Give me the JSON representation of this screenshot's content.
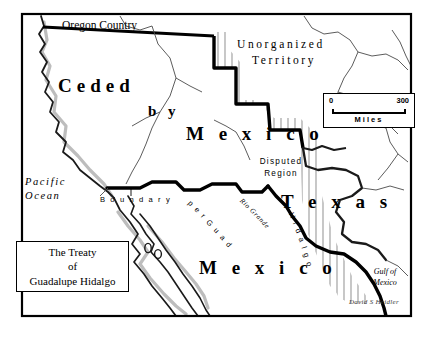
{
  "map": {
    "title_box": {
      "line1": "The Treaty",
      "line2": "of",
      "line3": "Guadalupe Hidalgo"
    },
    "scale": {
      "min": "0",
      "max": "300",
      "unit": "Miles"
    },
    "signature": "David S Heidler",
    "regions": [
      {
        "name": "ceded-word-1",
        "label": "Ceded"
      },
      {
        "name": "ceded-word-2",
        "label": "b y"
      },
      {
        "name": "ceded-word-3",
        "label": "M e x i c o"
      },
      {
        "name": "oregon-country",
        "label": "Oregon Country"
      },
      {
        "name": "unorganized-line1",
        "label": "Unorganized"
      },
      {
        "name": "unorganized-line2",
        "label": "Territory"
      },
      {
        "name": "texas",
        "label": "T e x a s"
      },
      {
        "name": "mexico",
        "label": "M e x i c o"
      },
      {
        "name": "disputed-line1",
        "label": "Disputed"
      },
      {
        "name": "disputed-line2",
        "label": "Region"
      },
      {
        "name": "pacific-line1",
        "label": "Pacific"
      },
      {
        "name": "pacific-line2",
        "label": "Ocean"
      },
      {
        "name": "gulf-line1",
        "label": "Gulf of"
      },
      {
        "name": "gulf-line2",
        "label": "Mexico"
      }
    ],
    "boundary_label": {
      "word1": "B o u n d a r y",
      "curve": "p e r   G u a d a l u p e",
      "curve2": "H i d a l g o",
      "river": "Rio Grande"
    },
    "colors": {
      "ink": "#000000",
      "paper": "#ffffff",
      "hatch": "#9a9a9a",
      "shadow": "#b9b9b9",
      "thin_line": "#4a4a4a"
    }
  }
}
